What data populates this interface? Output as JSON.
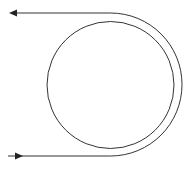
{
  "diagram": {
    "type": "wrapped-loop",
    "colors": {
      "background": "#ffffff",
      "stroke": "#333333"
    },
    "inner_circle": {
      "cx": 110.5,
      "cy": 85,
      "r": 63.5
    },
    "outer_path": {
      "top_y": 13,
      "bottom_y": 156,
      "left_x_top": 10,
      "left_x_bottom": 8,
      "arc_center": {
        "cx": 110.5,
        "cy": 84.5
      },
      "arc_r": 71.5
    },
    "arrows": [
      {
        "name": "outgoing-arrow",
        "direction": "left",
        "x": 10,
        "y": 13
      },
      {
        "name": "incoming-arrow",
        "direction": "right",
        "x": 21,
        "y": 156
      }
    ]
  }
}
